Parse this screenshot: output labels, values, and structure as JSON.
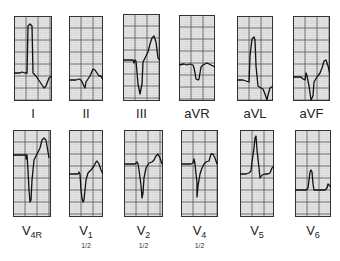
{
  "figure": {
    "type": "12-lead ECG strips",
    "grid_color": "#555555",
    "paper_color": "#e4e4e4",
    "trace_color": "#111111"
  },
  "leads": [
    {
      "id": "I",
      "label": "I",
      "sub": "",
      "note": "",
      "box": [
        14,
        16,
        38,
        85
      ],
      "trace": "0,57 6,57 8,56 11,57 13,57 14,10 16,8 18,10 19,57 22,60 26,66 30,72 32,70 35,62 38,60"
    },
    {
      "id": "II",
      "label": "II",
      "sub": "",
      "note": "",
      "box": [
        69,
        16,
        34,
        85
      ],
      "trace": "0,64 7,64 10,63 12,64 14,68 16,72 17,66 19,63 21,60 24,53 26,54 28,57 30,60 32,60 34,64"
    },
    {
      "id": "III",
      "label": "III",
      "sub": "",
      "note": "",
      "box": [
        123,
        14,
        37,
        87
      ],
      "trace": "0,46 10,46 11,49 12,46 13,47 15,70 17,80 19,70 20,48 22,44 25,38 27,30 29,24 31,22 33,28 35,44 37,46"
    },
    {
      "id": "aVR",
      "label": "aVR",
      "sub": "",
      "note": "",
      "box": [
        179,
        15,
        36,
        86
      ],
      "trace": "0,50 5,49 8,50 11,49 14,50 15,53 16,58 17,64 19,65 20,64 21,58 22,52 24,50 28,48 32,50 36,52"
    },
    {
      "id": "aVL",
      "label": "aVL",
      "sub": "",
      "note": "",
      "box": [
        237,
        16,
        36,
        85
      ],
      "trace": "0,64 6,64 9,65 12,66 13,40 15,23 17,21 18,24 19,50 21,70 24,72 26,73 28,78 30,84 31,79 33,72 36,70"
    },
    {
      "id": "aVF",
      "label": "aVF",
      "sub": "",
      "note": "",
      "box": [
        293,
        16,
        37,
        85
      ],
      "trace": "0,61 8,61 10,63 12,64 13,57 14,60 16,70 18,84 20,80 21,66 24,61 27,57 29,52 31,45 33,44 35,50 37,58"
    }
  ],
  "leads_bottom": [
    {
      "id": "V4R",
      "label": "V",
      "sub": "4R",
      "note": "",
      "box": [
        13,
        130,
        38,
        87
      ],
      "trace": "0,25 13,25 13,29 14,25 15,40 16,60 17,72 18,70 19,50 21,30 23,26 25,22 27,18 29,10 31,8 33,10 35,22 36,28"
    },
    {
      "id": "V1",
      "label": "V",
      "sub": "1",
      "note": "1/2",
      "box": [
        69,
        130,
        34,
        87
      ],
      "trace": "0,44 9,44 10,42 11,44 12,60 13,68 14,72 15,70 17,50 19,43 22,40 25,36 27,32 28,31 30,34 32,40 34,44"
    },
    {
      "id": "V2",
      "label": "V",
      "sub": "2",
      "note": "1/2",
      "box": [
        124,
        130,
        39,
        87
      ],
      "trace": "0,34 11,34 13,32 14,34 15,40 17,55 18,68 19,63 20,48 22,38 25,33 28,32 30,30 32,26 34,24 36,28 38,34"
    },
    {
      "id": "V4",
      "label": "V",
      "sub": "4",
      "note": "1/2",
      "box": [
        181,
        130,
        37,
        87
      ],
      "trace": "0,34 10,34 12,33 13,29 14,34 15,44 16,52 16,67 17,56 19,44 21,38 23,34 25,32 28,31 30,24 32,24 34,28 36,34"
    },
    {
      "id": "V5",
      "label": "V",
      "sub": "5",
      "note": "",
      "box": [
        240,
        130,
        34,
        87
      ],
      "trace": "0,44 6,44 9,43 11,41 12,32 14,18 15,8 16,6 17,20 19,38 20,48 22,45 25,44 28,44 30,43 32,38 34,36"
    },
    {
      "id": "V6",
      "label": "V",
      "sub": "6",
      "note": "",
      "box": [
        295,
        130,
        36,
        87
      ],
      "trace": "0,60 8,60 11,60 13,58 14,50 15,42 16,40 17,42 18,54 19,60 23,60 27,60 30,60 32,58 33,54 35,56 36,58"
    }
  ]
}
